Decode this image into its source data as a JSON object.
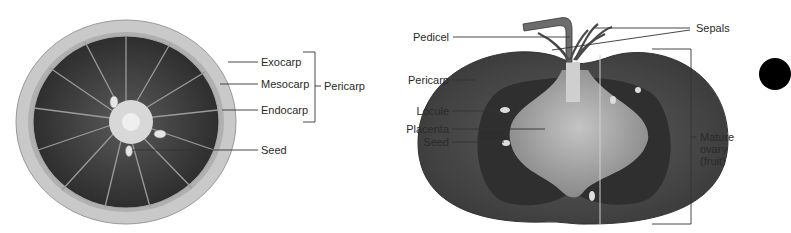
{
  "citrus": {
    "labels": {
      "exocarp": "Exocarp",
      "mesocarp": "Mesocarp",
      "endocarp": "Endocarp",
      "pericarp": "Pericarp",
      "seed": "Seed"
    }
  },
  "tomato": {
    "labels": {
      "pedicel": "Pedicel",
      "sepals": "Sepals",
      "pericarp": "Pericarp",
      "locule": "Locule",
      "placenta": "Placenta",
      "seed": "Seed",
      "mature_ovary_line1": "Mature",
      "mature_ovary_line2": "ovary",
      "mature_ovary_line3": "(fruit)"
    }
  },
  "colors": {
    "rind": "#c8c8c8",
    "flesh": "#3a3a3a",
    "tomato_skin": "#4a4a4a",
    "placenta": "#b5b5b5",
    "leader_line": "#333333",
    "dot": "#000000"
  }
}
